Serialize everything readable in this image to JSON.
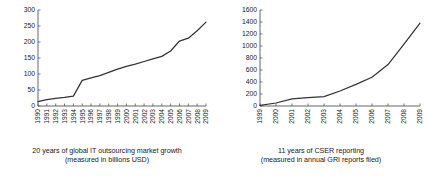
{
  "figure": {
    "panels": [
      {
        "id": "it-outsourcing",
        "caption_line1": "20 years of global IT outsourcing market growth",
        "caption_line2": "(measured in billions USD)"
      },
      {
        "id": "cser-reporting",
        "caption_line1": "11 years of CSER reporting",
        "caption_line2": "(measured in annual GRI reports filed)"
      }
    ]
  },
  "chart_data": [
    {
      "type": "line",
      "title": "20 years of global IT outsourcing market growth",
      "subtitle": "(measured in billions USD)",
      "xlabel": "",
      "ylabel": "",
      "grid": false,
      "legend": "none",
      "categories": [
        "1990",
        "1991",
        "1992",
        "1993",
        "1994",
        "1995",
        "1996",
        "1997",
        "1998",
        "1999",
        "2000",
        "2001",
        "2002",
        "2003",
        "2004",
        "2005",
        "2006",
        "2007",
        "2008",
        "2009"
      ],
      "x": [
        1990,
        1991,
        1992,
        1993,
        1994,
        1995,
        1996,
        1997,
        1998,
        1999,
        2000,
        2001,
        2002,
        2003,
        2004,
        2005,
        2006,
        2007,
        2008,
        2009
      ],
      "values": [
        14,
        20,
        24,
        27,
        31,
        80,
        88,
        95,
        105,
        115,
        124,
        131,
        139,
        147,
        155,
        172,
        203,
        212,
        235,
        262
      ],
      "ylim": [
        0,
        300
      ],
      "yticks": [
        0,
        50,
        100,
        150,
        200,
        250,
        300
      ],
      "xlim": [
        1990,
        2009
      ]
    },
    {
      "type": "line",
      "title": "11 years of CSER reporting",
      "subtitle": "(measured in annual GRI reports filed)",
      "xlabel": "",
      "ylabel": "",
      "grid": false,
      "legend": "none",
      "categories": [
        "1999",
        "2000",
        "2001",
        "2002",
        "2003",
        "2004",
        "2005",
        "2006",
        "2007",
        "2008",
        "2009"
      ],
      "x": [
        1999,
        2000,
        2001,
        2002,
        2003,
        2004,
        2005,
        2006,
        2007,
        2008,
        2009
      ],
      "values": [
        10,
        50,
        120,
        140,
        155,
        250,
        360,
        480,
        690,
        1030,
        1380
      ],
      "ylim": [
        0,
        1600
      ],
      "yticks": [
        0,
        200,
        400,
        600,
        800,
        1000,
        1200,
        1400,
        1600
      ],
      "xlim": [
        1999,
        2009
      ]
    }
  ]
}
